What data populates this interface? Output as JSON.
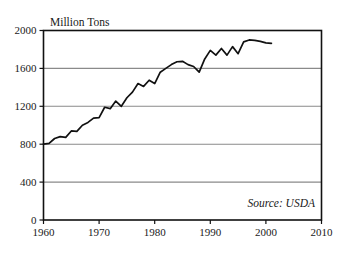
{
  "chart_data": {
    "type": "line",
    "title": "",
    "ylabel": "Million Tons",
    "xlabel": "",
    "xlim": [
      1960,
      2010
    ],
    "ylim": [
      0,
      2000
    ],
    "grid": true,
    "legend": null,
    "annotation": "Source: USDA",
    "xticks": [
      "1960",
      "1970",
      "1980",
      "1990",
      "2000",
      "2010"
    ],
    "xtick_values": [
      1960,
      1970,
      1980,
      1990,
      2000,
      2010
    ],
    "yticks": [
      "0",
      "400",
      "800",
      "1200",
      "1600",
      "2000"
    ],
    "ytick_values": [
      0,
      400,
      800,
      1200,
      1600,
      2000
    ],
    "series": [
      {
        "name": "Production",
        "x": [
          1960,
          1961,
          1962,
          1963,
          1964,
          1965,
          1966,
          1967,
          1968,
          1969,
          1970,
          1971,
          1972,
          1973,
          1974,
          1975,
          1976,
          1977,
          1978,
          1979,
          1980,
          1981,
          1982,
          1983,
          1984,
          1985,
          1986,
          1987,
          1988,
          1989,
          1990,
          1991,
          1992,
          1993,
          1994,
          1995,
          1996,
          1997,
          1998,
          1999,
          2000,
          2001
        ],
        "values": [
          800,
          808,
          860,
          880,
          872,
          940,
          935,
          1000,
          1030,
          1075,
          1080,
          1190,
          1175,
          1255,
          1200,
          1290,
          1350,
          1440,
          1410,
          1475,
          1440,
          1560,
          1600,
          1640,
          1670,
          1675,
          1640,
          1620,
          1560,
          1700,
          1790,
          1740,
          1810,
          1740,
          1830,
          1755,
          1880,
          1900,
          1895,
          1885,
          1870,
          1865
        ]
      }
    ]
  },
  "axes": {
    "ytitle": "Million Tons",
    "source": "Source: USDA"
  }
}
